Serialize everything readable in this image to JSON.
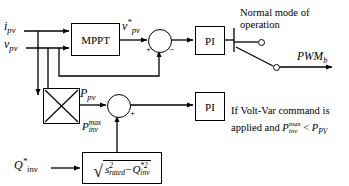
{
  "diagram": {
    "line_color": "#000000",
    "background": "#ffffff"
  },
  "inputs": {
    "i_pv": {
      "base": "i",
      "sub": "pv"
    },
    "v_pv": {
      "base": "v",
      "sub": "pv"
    },
    "q_inv_ref": {
      "base": "Q",
      "sup": "*",
      "sub": "inv"
    }
  },
  "blocks": {
    "mppt": {
      "label": "MPPT"
    },
    "multiplier": {
      "label": "",
      "icon": "multiplier-cross"
    },
    "pi_top": {
      "label": "PI"
    },
    "pi_bottom": {
      "label": "PI"
    },
    "sqrt": {
      "radicand_first": "s",
      "radicand_first_sup": "2",
      "radicand_first_sub": "rated",
      "operator": "−",
      "radicand_second": "Q",
      "radicand_second_sup": "*2",
      "radicand_second_sub": "inv"
    }
  },
  "signals": {
    "v_pv_ref": {
      "base": "v",
      "sup": "*",
      "sub": "pv"
    },
    "p_pv": {
      "base": "P",
      "sub": "pv"
    },
    "p_inv_max": {
      "base": "P",
      "sup": "max",
      "sub": "inv"
    },
    "pwm_out": {
      "base": "PWM",
      "sub": "b"
    }
  },
  "sum_signs": {
    "top_plus": "+",
    "top_minus": "−",
    "bottom_minus": "−",
    "bottom_plus": "+"
  },
  "annotations": {
    "normal_mode": {
      "line1": "Normal mode of",
      "line2": "operation"
    },
    "volt_var": {
      "line1": "If Volt-Var command is",
      "line2_pre": "applied and ",
      "line2_sym_base": "P",
      "line2_sym_sup": "max",
      "line2_sym_sub": "inv",
      "line2_rel": " < ",
      "line2_sym2_base": "P",
      "line2_sym2_sub": "PV"
    }
  },
  "switch": {
    "contact_upper": "normal-mode-contact",
    "contact_lower": "volt-var-contact"
  }
}
